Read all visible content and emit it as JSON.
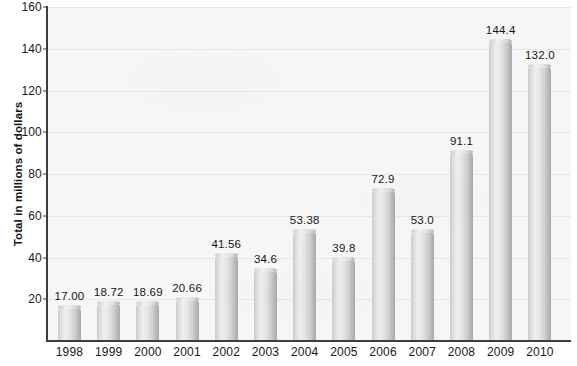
{
  "chart_data": {
    "type": "bar",
    "title": "",
    "subtitle": "",
    "xlabel": "",
    "ylabel": "Total in millions of dollars",
    "categories": [
      "1998",
      "1999",
      "2000",
      "2001",
      "2002",
      "2003",
      "2004",
      "2005",
      "2006",
      "2007",
      "2008",
      "2009",
      "2010"
    ],
    "values": [
      17.0,
      18.72,
      18.69,
      20.66,
      41.56,
      34.6,
      53.38,
      39.8,
      72.9,
      53.0,
      91.1,
      144.4,
      132.0
    ],
    "value_labels": [
      "17.00",
      "18.72",
      "18.69",
      "20.66",
      "41.56",
      "34.6",
      "53.38",
      "39.8",
      "72.9",
      "53.0",
      "91.1",
      "144.4",
      "132.0"
    ],
    "ylim": [
      0,
      160
    ],
    "yticks": [
      20,
      40,
      60,
      80,
      100,
      120,
      140,
      160
    ],
    "ytick_labels": [
      "20",
      "40",
      "60",
      "80",
      "100",
      "120",
      "140",
      "160"
    ],
    "grid": true,
    "grid_axis": "y",
    "legend": null,
    "legend_position": "none",
    "bar_color": "#dcdcdc",
    "bar_edge_color": "#a8a8a8",
    "plot_background": "#f6f6f6",
    "gridline_color": "#e6e6e6",
    "axis_color": "#3d3d3d",
    "text_color": "#161616"
  }
}
